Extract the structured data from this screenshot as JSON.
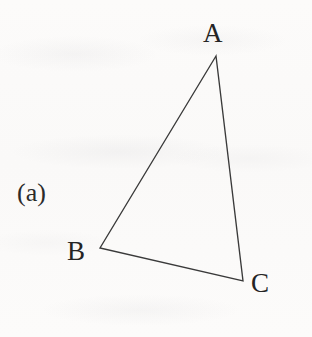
{
  "figure": {
    "panel_caption": "(a)",
    "background_color": "#fbfaf9",
    "stroke_color": "#3a3a3a",
    "text_color": "#242424",
    "width": 312,
    "height": 337,
    "shape": "triangle"
  },
  "vertices": [
    {
      "label": "A",
      "x": 216,
      "y": 56,
      "label_x": 203,
      "label_y": 20,
      "position": "apex-top-right"
    },
    {
      "label": "B",
      "x": 100,
      "y": 248,
      "label_x": 67,
      "label_y": 238,
      "position": "lower-left"
    },
    {
      "label": "C",
      "x": 243,
      "y": 281,
      "label_x": 251,
      "label_y": 270,
      "position": "bottom-right"
    }
  ],
  "edges": [
    {
      "name": "AB",
      "from": "A",
      "to": "B"
    },
    {
      "name": "BC",
      "from": "B",
      "to": "C"
    },
    {
      "name": "CA",
      "from": "C",
      "to": "A"
    }
  ]
}
